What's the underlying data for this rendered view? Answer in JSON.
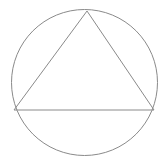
{
  "diagram": {
    "background": "#ffffff",
    "stroke_color": "#8a8a8a",
    "stroke_width": 1,
    "circle": {
      "cx": 84.5,
      "cy": 82.5,
      "r": 73
    },
    "triangle": {
      "points": [
        {
          "x": 87,
          "y": 11
        },
        {
          "x": 14,
          "y": 110
        },
        {
          "x": 154,
          "y": 110
        }
      ]
    },
    "labels": []
  }
}
